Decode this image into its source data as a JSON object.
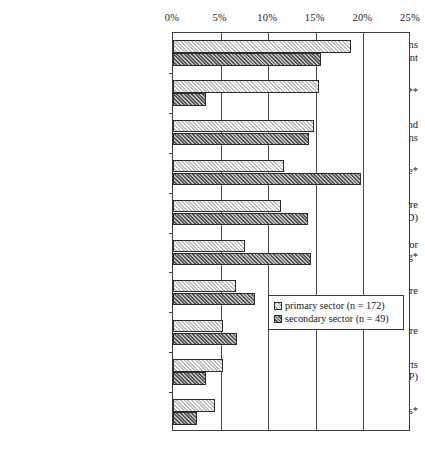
{
  "chart_data": {
    "type": "bar",
    "orientation": "horizontal",
    "title": "",
    "xlabel": "",
    "ylabel": "",
    "xlim": [
      0,
      25
    ],
    "xunit": "%",
    "grid": true,
    "legend_position": "inner-right",
    "tick_labels": [
      "0%",
      "5%",
      "10%",
      "15%",
      "20%",
      "25%"
    ],
    "tick_values": [
      0,
      5,
      10,
      15,
      20,
      25
    ],
    "categories": [
      "software applications\nfor business management",
      "other software**",
      "software for multimedia and\ninternet applications",
      "systems-related software*",
      "technical application software\n(e.g. CAD)",
      "software for\nautomatic control engineering*",
      "finance and retail software",
      "tools for the development of software",
      "office automation and graphic charts\n(e.g. office products, DTP)",
      "libraries of progams*"
    ],
    "series": [
      {
        "name": "primary sector (n = 172)",
        "key": "primary",
        "values": [
          18.7,
          15.3,
          14.8,
          11.7,
          11.3,
          7.6,
          6.6,
          5.3,
          5.2,
          4.4
        ]
      },
      {
        "name": "secondary sector (n = 49)",
        "key": "secondary",
        "values": [
          15.5,
          3.5,
          14.3,
          19.8,
          14.2,
          14.5,
          8.6,
          6.7,
          3.5,
          2.5
        ]
      }
    ]
  },
  "legend": {
    "items": [
      {
        "label": "primary sector (n = 172)",
        "swatch": "primary"
      },
      {
        "label": "secondary sector (n = 49)",
        "swatch": "secondary"
      }
    ]
  },
  "colors": {
    "primary_fill": "#c9c9c9",
    "secondary_fill": "#6d6d6d",
    "axis": "#3d3d3d",
    "background": "#ffffff"
  }
}
